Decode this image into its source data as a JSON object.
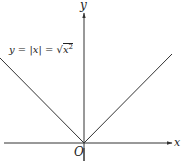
{
  "diagram": {
    "equation": {
      "lhs": "y",
      "eq1": " = ",
      "abs": "|x|",
      "eq2": " = ",
      "sqrt_symbol": "√",
      "radicand": "x",
      "exponent": "2"
    },
    "axes": {
      "x_label": "x",
      "y_label": "y",
      "origin_label": "O"
    },
    "colors": {
      "line": "#333333",
      "axis": "#333333",
      "background": "#ffffff"
    }
  }
}
